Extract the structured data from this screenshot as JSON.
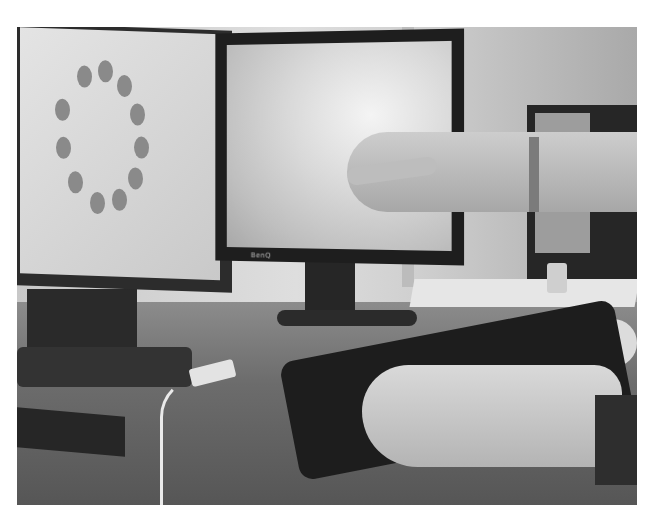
{
  "image": {
    "description": "Grayscale photo of a desk with three monitors; a hand points at the center monitor while the other hand rests on a keyboard",
    "elements": {
      "left_monitor": {
        "content": "ring of twelve gray dots on light screen"
      },
      "center_monitor": {
        "content": "cloud/sky image",
        "logo": "BenQ"
      },
      "right_monitor": {
        "content": "partially visible dark monitor"
      },
      "keyboard": "black keyboard",
      "mouse": "white mouse",
      "usb_device": "white USB dongle with cable",
      "pointing_hand": "hand pointing at center screen with bracelet",
      "typing_hand": "hand resting on keyboard"
    },
    "colors": {
      "screen": "#d9d9d9",
      "monitor_frame": "#1e1e1e",
      "desk": "#6c6c6c",
      "dot": "#8a8a8a"
    }
  }
}
